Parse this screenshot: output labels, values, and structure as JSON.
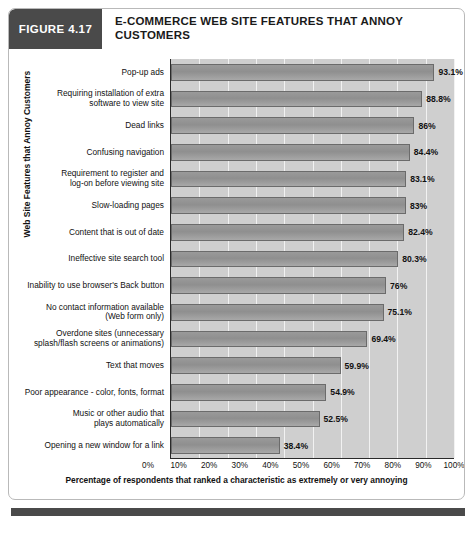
{
  "figure": {
    "number_label": "FIGURE 4.17",
    "title": "E-COMMERCE WEB SITE FEATURES THAT ANNOY CUSTOMERS"
  },
  "chart_data": {
    "type": "bar",
    "orientation": "horizontal",
    "title": "E-COMMERCE WEB SITE FEATURES THAT ANNOY CUSTOMERS",
    "xlabel": "Percentage of respondents that ranked a characteristic as extremely or very annoying",
    "ylabel": "Web Site Features that Annoy Customers",
    "xlim": [
      0,
      100
    ],
    "xticks": [
      "0%",
      "10%",
      "20%",
      "30%",
      "40%",
      "50%",
      "60%",
      "70%",
      "80%",
      "90%",
      "100%"
    ],
    "grid": true,
    "legend": "none",
    "bar_color": "#949494",
    "plot_background": "#cfcfcf",
    "categories": [
      "Pop-up ads",
      "Requiring installation of extra software to view site",
      "Dead links",
      "Confusing navigation",
      "Requirement to register and log-on before viewing site",
      "Slow-loading pages",
      "Content that is out of date",
      "Ineffective site search tool",
      "Inability to use browser's Back button",
      "No contact information available (Web form only)",
      "Overdone sites (unnecessary splash/flash screens or animations)",
      "Text that moves",
      "Poor appearance - color, fonts, format",
      "Music or other audio that plays automatically",
      "Opening a new window for a link"
    ],
    "values": [
      93.1,
      88.8,
      86,
      84.4,
      83.1,
      83,
      82.4,
      80.3,
      76,
      75.1,
      69.4,
      59.9,
      54.9,
      52.5,
      38.4
    ],
    "value_labels": [
      "93.1%",
      "88.8%",
      "86%",
      "84.4%",
      "83.1%",
      "83%",
      "82.4%",
      "80.3%",
      "76%",
      "75.1%",
      "69.4%",
      "59.9%",
      "54.9%",
      "52.5%",
      "38.4%"
    ],
    "category_label_lines": [
      [
        "Pop-up ads"
      ],
      [
        "Requiring installation of extra",
        "software to view site"
      ],
      [
        "Dead links"
      ],
      [
        "Confusing navigation"
      ],
      [
        "Requirement to register and",
        "log-on before viewing site"
      ],
      [
        "Slow-loading pages"
      ],
      [
        "Content that is out of date"
      ],
      [
        "Ineffective site search tool"
      ],
      [
        "Inability to use browser's Back button"
      ],
      [
        "No contact information available",
        "(Web form only)"
      ],
      [
        "Overdone sites (unnecessary",
        "splash/flash screens or animations)"
      ],
      [
        "Text that moves"
      ],
      [
        "Poor appearance - color, fonts, format"
      ],
      [
        "Music or other audio that",
        "plays automatically"
      ],
      [
        "Opening a new window for a link"
      ]
    ]
  }
}
